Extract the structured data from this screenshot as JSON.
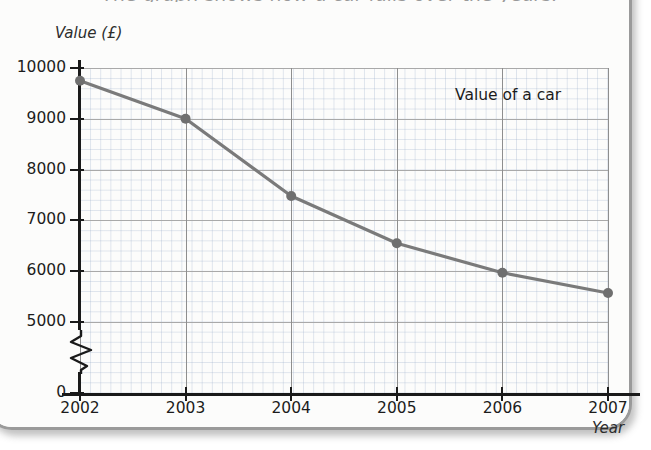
{
  "page": {
    "title": "The graph shows how a car falls over the years."
  },
  "chart_data": {
    "type": "line",
    "title": "The graph shows how a car falls over the years.",
    "xlabel": "Year",
    "ylabel": "Value (£)",
    "categories": [
      "2002",
      "2003",
      "2004",
      "2005",
      "2006",
      "2007"
    ],
    "values": [
      9750,
      9000,
      7480,
      6550,
      5970,
      5570
    ],
    "series": [
      {
        "name": "Value of a car",
        "values": [
          9750,
          9000,
          7480,
          6550,
          5970,
          5570
        ],
        "color": "#7a7a7a"
      }
    ],
    "ylim": [
      0,
      10000
    ],
    "y_ticks": [
      "0",
      "5000",
      "6000",
      "7000",
      "8000",
      "9000",
      "10000"
    ],
    "y_tick_values": [
      0,
      5000,
      6000,
      7000,
      8000,
      9000,
      10000
    ],
    "x_ticks": [
      "2002",
      "2003",
      "2004",
      "2005",
      "2006",
      "2007"
    ],
    "axis_break": true,
    "axis_break_between": [
      0,
      5000
    ],
    "grid": true,
    "grid_minor": true,
    "legend": "none",
    "annotations": [
      {
        "text": "Value of a car",
        "x": "2006",
        "y": 9000
      }
    ]
  },
  "colors": {
    "series_line": "#7a7a7a",
    "marker": "#6f6f6f",
    "axis": "#1a1a1a",
    "grid_major": "#a9a9a9",
    "grid_minor": "#aab8cc",
    "page_border": "#9a9a9a",
    "page_background": "#fbfbfa"
  }
}
